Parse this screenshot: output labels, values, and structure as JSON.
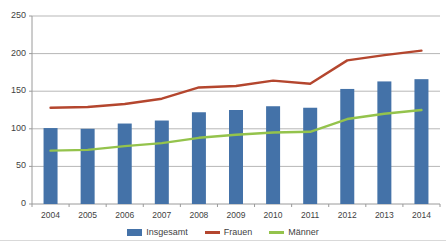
{
  "title_partial": "",
  "axis": {
    "y_ticks": [
      0,
      50,
      100,
      150,
      200,
      250
    ],
    "y_min": 0,
    "y_max": 250
  },
  "legend": {
    "items": [
      {
        "label": "Insgesamt",
        "color": "#4472a8",
        "type": "bar"
      },
      {
        "label": "Frauen",
        "color": "#b4462e",
        "type": "line"
      },
      {
        "label": "Männer",
        "color": "#94c34c",
        "type": "line"
      }
    ]
  },
  "chart_data": {
    "type": "bar",
    "title": "",
    "subtitle": "",
    "xlabel": "",
    "ylabel": "",
    "ylim": [
      0,
      250
    ],
    "grid": true,
    "legend_position": "bottom",
    "categories": [
      "2004",
      "2005",
      "2006",
      "2007",
      "2008",
      "2009",
      "2010",
      "2011",
      "2012",
      "2013",
      "2014"
    ],
    "series": [
      {
        "name": "Insgesamt",
        "type": "bar",
        "color": "#4472a8",
        "values": [
          101,
          100,
          107,
          111,
          122,
          125,
          130,
          128,
          153,
          163,
          166
        ]
      },
      {
        "name": "Frauen",
        "type": "line",
        "color": "#b4462e",
        "values": [
          128,
          129,
          133,
          140,
          155,
          157,
          164,
          160,
          191,
          198,
          204
        ]
      },
      {
        "name": "Männer",
        "type": "line",
        "color": "#94c34c",
        "values": [
          71,
          72,
          77,
          81,
          88,
          92,
          95,
          96,
          113,
          120,
          125
        ]
      }
    ]
  }
}
